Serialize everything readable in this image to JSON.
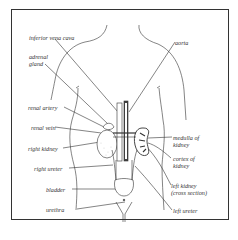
{
  "diagram": {
    "labels": {
      "inferior_vena_cava": "inferior vena cava",
      "aorta": "aorta",
      "adrenal_gland_1": "adrenal",
      "adrenal_gland_2": "gland",
      "renal_artery": "renal artery",
      "renal_vein": "renal vein",
      "right_kidney": "right kidney",
      "right_ureter": "right ureter",
      "bladder": "bladder",
      "urethra": "urethra",
      "medulla_1": "medulla of",
      "medulla_2": "kidney",
      "cortex_1": "cortex of",
      "cortex_2": "kidney",
      "left_kidney_1": "left kidney",
      "left_kidney_2": "(cross section)",
      "left_ureter": "left ureter"
    },
    "colors": {
      "line": "#333333",
      "background": "#ffffff"
    }
  }
}
